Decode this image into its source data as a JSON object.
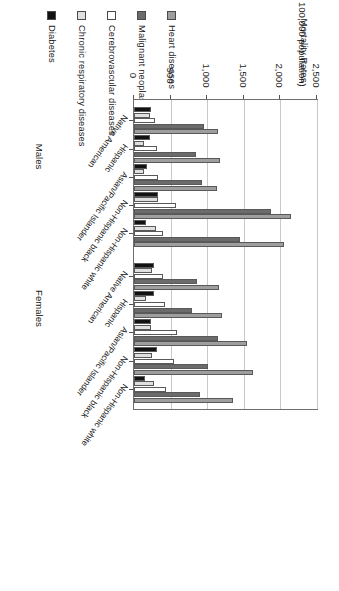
{
  "chart_data": {
    "type": "bar",
    "orientation": "horizontal",
    "title": "",
    "ylabel_line1": "Mortality Rates",
    "ylabel_line2": "(per 100,000 population)",
    "xlabel": "",
    "value_axis_ticks": [
      "0",
      "500",
      "1,000",
      "1,500",
      "2,000",
      "2,500"
    ],
    "value_axis_tick_values": [
      0,
      500,
      1000,
      1500,
      2000,
      2500
    ],
    "xlim": [
      0,
      2500
    ],
    "grid": "vertical",
    "legend_position": "top",
    "legend": [
      {
        "label": "Heart diseases",
        "color": "#9e9e9e"
      },
      {
        "label": "Malignant neoplasms",
        "color": "#6b6b6b"
      },
      {
        "label": "Cerebrovascular diseases",
        "color": "#ffffff"
      },
      {
        "label": "Chronic respiratory diseases",
        "color": "#e0e0e0"
      },
      {
        "label": "Diabetes",
        "color": "#121212"
      }
    ],
    "series": [
      {
        "name": "Heart diseases"
      },
      {
        "name": "Malignant neoplasms"
      },
      {
        "name": "Cerebrovascular diseases"
      },
      {
        "name": "Chronic respiratory diseases"
      },
      {
        "name": "Diabetes"
      }
    ],
    "panels": [
      {
        "sex": "Males",
        "categories": [
          "Non-Hispanic white",
          "Non-Hispanic black",
          "Asian/Pacific Islander",
          "Hispanic",
          "Native American"
        ],
        "values": [
          [
            2050,
            1450,
            400,
            300,
            160
          ],
          [
            2150,
            1870,
            570,
            330,
            330
          ],
          [
            1130,
            930,
            330,
            140,
            180
          ],
          [
            1180,
            850,
            320,
            140,
            220
          ],
          [
            1150,
            950,
            290,
            220,
            230
          ]
        ]
      },
      {
        "sex": "Females",
        "categories": [
          "Non-Hispanic white",
          "Non-Hispanic black",
          "Asian/Pacific Islander",
          "Hispanic",
          "Native American"
        ],
        "values": [
          [
            1350,
            900,
            440,
            270,
            150
          ],
          [
            1620,
            1010,
            540,
            250,
            320
          ],
          [
            1540,
            1150,
            590,
            230,
            230
          ],
          [
            1200,
            790,
            430,
            170,
            270
          ],
          [
            1160,
            860,
            400,
            250,
            280
          ]
        ]
      }
    ]
  }
}
